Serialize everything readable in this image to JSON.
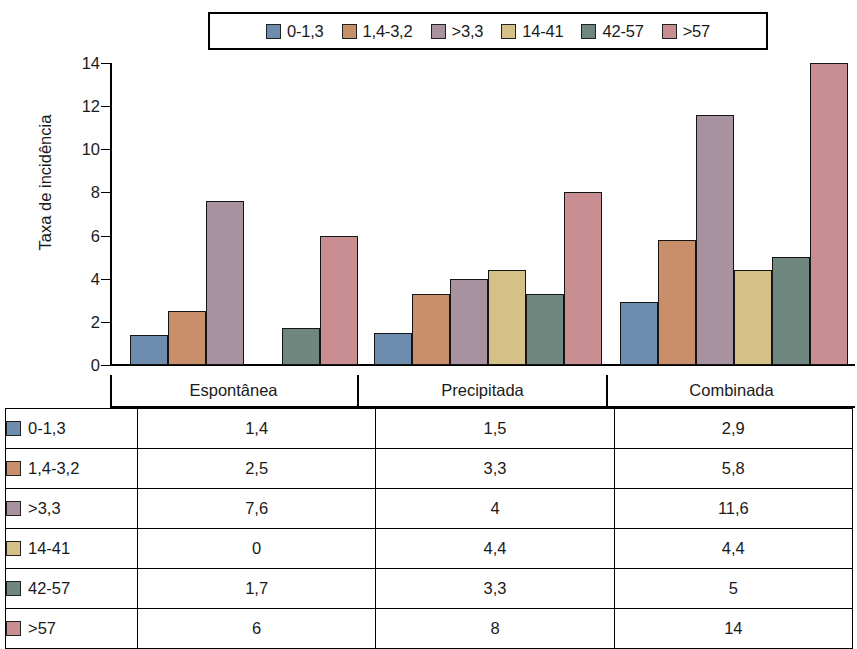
{
  "chart_data": {
    "type": "bar",
    "title": "",
    "xlabel": "",
    "ylabel": "Taxa de incidência",
    "ylim": [
      0,
      14
    ],
    "yticks": [
      "0",
      "2",
      "4",
      "6",
      "8",
      "10",
      "12",
      "14"
    ],
    "grid": false,
    "legend_position": "top",
    "categories": [
      "Espontânea",
      "Precipitada",
      "Combinada"
    ],
    "series": [
      {
        "name": "0-1,3",
        "color": "#6e8cad",
        "values": [
          1.4,
          1.5,
          2.9
        ],
        "labels": [
          "1,4",
          "1,5",
          "2,9"
        ]
      },
      {
        "name": "1,4-3,2",
        "color": "#c98f6b",
        "values": [
          2.5,
          3.3,
          5.8
        ],
        "labels": [
          "2,5",
          "3,3",
          "5,8"
        ]
      },
      {
        "name": ">3,3",
        "color": "#a8929f",
        "values": [
          7.6,
          4.0,
          11.6
        ],
        "labels": [
          "7,6",
          "4",
          "11,6"
        ]
      },
      {
        "name": "14-41",
        "color": "#d5c187",
        "values": [
          0,
          4.4,
          4.4
        ],
        "labels": [
          "0",
          "4,4",
          "4,4"
        ]
      },
      {
        "name": "42-57",
        "color": "#6f877f",
        "values": [
          1.7,
          3.3,
          5.0
        ],
        "labels": [
          "1,7",
          "3,3",
          "5"
        ]
      },
      {
        "name": ">57",
        "color": "#c98e92",
        "values": [
          6.0,
          8.0,
          14.0
        ],
        "labels": [
          "6",
          "8",
          "14"
        ]
      }
    ]
  },
  "legend": {
    "items": [
      {
        "label": "0-1,3",
        "color": "#6e8cad"
      },
      {
        "label": "1,4-3,2",
        "color": "#c98f6b"
      },
      {
        "label": ">3,3",
        "color": "#a8929f"
      },
      {
        "label": "14-41",
        "color": "#d5c187"
      },
      {
        "label": "42-57",
        "color": "#6f877f"
      },
      {
        "label": ">57",
        "color": "#c98e92"
      }
    ]
  },
  "axis": {
    "y_title": "Taxa de incidência",
    "y_ticks": [
      "14",
      "12",
      "10",
      "8",
      "6",
      "4",
      "2",
      "0"
    ]
  },
  "categories": [
    "Espontânea",
    "Precipitada",
    "Combinada"
  ],
  "table": {
    "rows": [
      {
        "label": "0-1,3",
        "color": "#6e8cad",
        "cells": [
          "1,4",
          "1,5",
          "2,9"
        ]
      },
      {
        "label": "1,4-3,2",
        "color": "#c98f6b",
        "cells": [
          "2,5",
          "3,3",
          "5,8"
        ]
      },
      {
        "label": ">3,3",
        "color": "#a8929f",
        "cells": [
          "7,6",
          "4",
          "11,6"
        ]
      },
      {
        "label": "14-41",
        "color": "#d5c187",
        "cells": [
          "0",
          "4,4",
          "4,4"
        ]
      },
      {
        "label": "42-57",
        "color": "#6f877f",
        "cells": [
          "1,7",
          "3,3",
          "5"
        ]
      },
      {
        "label": ">57",
        "color": "#c98e92",
        "cells": [
          "6",
          "8",
          "14"
        ]
      }
    ]
  }
}
